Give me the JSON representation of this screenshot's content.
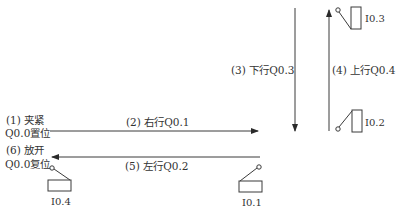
{
  "diagram": {
    "type": "motion-sequence",
    "stroke_color": "#3a3a3a",
    "steps": [
      {
        "id": 1,
        "label_line1": "(1) 夹紧",
        "label_line2": "Q0.0置位"
      },
      {
        "id": 2,
        "label": "(2) 右行Q0.1",
        "direction": "right"
      },
      {
        "id": 3,
        "label": "(3) 下行Q0.3",
        "direction": "down"
      },
      {
        "id": 4,
        "label": "(4) 上行Q0.4",
        "direction": "up"
      },
      {
        "id": 5,
        "label": "(5) 左行Q0.2",
        "direction": "left"
      },
      {
        "id": 6,
        "label_line1": "(6) 放开",
        "label_line2": "Q0.0复位"
      }
    ],
    "switches": [
      {
        "name": "I0.4",
        "position": "left-bottom"
      },
      {
        "name": "I0.1",
        "position": "right-bottom"
      },
      {
        "name": "I0.3",
        "position": "upper-limit"
      },
      {
        "name": "I0.2",
        "position": "lower-limit"
      }
    ]
  }
}
